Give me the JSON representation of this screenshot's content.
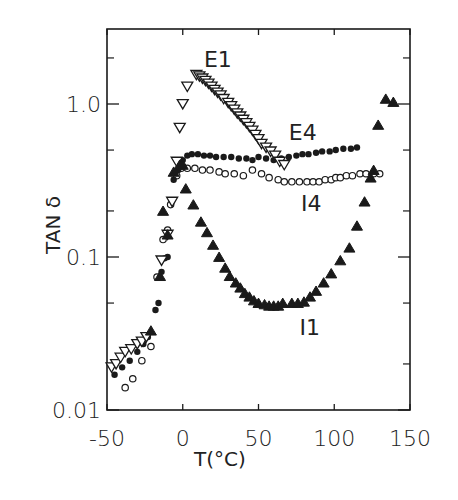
{
  "chart_data": {
    "type": "scatter",
    "title": "",
    "xlabel": "T(°C)",
    "ylabel": "TAN δ",
    "xscale": "linear",
    "yscale": "log",
    "xlim": [
      -50,
      150
    ],
    "ylim": [
      0.01,
      3.0
    ],
    "xticks": [
      -50,
      0,
      50,
      100,
      150
    ],
    "xtick_labels": [
      "-50",
      "0",
      "50",
      "100",
      "150"
    ],
    "yticks": [
      0.01,
      0.1,
      1.0
    ],
    "ytick_labels": [
      "0.01",
      "0.1",
      "1.0"
    ],
    "y_minor_ticks": [
      0.02,
      0.05,
      0.2,
      0.5,
      2.0
    ],
    "grid": false,
    "legend": "inline labels",
    "series": [
      {
        "name": "E1",
        "marker": "open-down-triangle",
        "label_pos": {
          "x": 14,
          "y": 1.75
        },
        "points": [
          [
            -47,
            0.019
          ],
          [
            -44,
            0.02
          ],
          [
            -41,
            0.022
          ],
          [
            -38,
            0.024
          ],
          [
            -34,
            0.025
          ],
          [
            -30,
            0.027
          ],
          [
            -27,
            0.028
          ],
          [
            -24,
            0.03
          ],
          [
            -14,
            0.095
          ],
          [
            -10,
            0.14
          ],
          [
            -7,
            0.23
          ],
          [
            -4,
            0.42
          ],
          [
            -2,
            0.7
          ],
          [
            0,
            1.0
          ],
          [
            3,
            1.3
          ],
          [
            9,
            1.55
          ],
          [
            11,
            1.52
          ],
          [
            13,
            1.47
          ],
          [
            15,
            1.42
          ],
          [
            17,
            1.36
          ],
          [
            19,
            1.3
          ],
          [
            21,
            1.24
          ],
          [
            23,
            1.19
          ],
          [
            25,
            1.14
          ],
          [
            27,
            1.08
          ],
          [
            30,
            1.02
          ],
          [
            32,
            0.97
          ],
          [
            34,
            0.92
          ],
          [
            36,
            0.87
          ],
          [
            38,
            0.83
          ],
          [
            40,
            0.79
          ],
          [
            42,
            0.75
          ],
          [
            44,
            0.71
          ],
          [
            46,
            0.67
          ],
          [
            48,
            0.63
          ],
          [
            50,
            0.59
          ],
          [
            52,
            0.55
          ],
          [
            55,
            0.52
          ],
          [
            58,
            0.49
          ],
          [
            61,
            0.46
          ],
          [
            64,
            0.42
          ],
          [
            67,
            0.4
          ]
        ]
      },
      {
        "name": "E4",
        "marker": "filled-circle",
        "label_pos": {
          "x": 70,
          "y": 0.58
        },
        "points": [
          [
            -45,
            0.017
          ],
          [
            -40,
            0.019
          ],
          [
            -35,
            0.021
          ],
          [
            -30,
            0.024
          ],
          [
            -26,
            0.027
          ],
          [
            -23,
            0.03
          ],
          [
            -18,
            0.045
          ],
          [
            -16,
            0.05
          ],
          [
            -14,
            0.08
          ],
          [
            -12,
            0.098
          ],
          [
            -10,
            0.1
          ],
          [
            -6,
            0.32
          ],
          [
            -3,
            0.37
          ],
          [
            0,
            0.43
          ],
          [
            3,
            0.46
          ],
          [
            6,
            0.47
          ],
          [
            10,
            0.47
          ],
          [
            14,
            0.46
          ],
          [
            18,
            0.46
          ],
          [
            22,
            0.45
          ],
          [
            27,
            0.45
          ],
          [
            32,
            0.45
          ],
          [
            37,
            0.44
          ],
          [
            42,
            0.44
          ],
          [
            46,
            0.43
          ],
          [
            50,
            0.45
          ],
          [
            55,
            0.44
          ],
          [
            60,
            0.43
          ],
          [
            65,
            0.44
          ],
          [
            70,
            0.45
          ],
          [
            75,
            0.46
          ],
          [
            79,
            0.47
          ],
          [
            83,
            0.47
          ],
          [
            88,
            0.48
          ],
          [
            92,
            0.49
          ],
          [
            97,
            0.49
          ],
          [
            101,
            0.5
          ],
          [
            106,
            0.51
          ],
          [
            111,
            0.51
          ],
          [
            115,
            0.52
          ]
        ]
      },
      {
        "name": "I4",
        "marker": "open-circle",
        "label_pos": {
          "x": 78,
          "y": 0.2
        },
        "points": [
          [
            -38,
            0.014
          ],
          [
            -33,
            0.016
          ],
          [
            -27,
            0.021
          ],
          [
            -21,
            0.026
          ],
          [
            -17,
            0.074
          ],
          [
            -13,
            0.13
          ],
          [
            -10,
            0.15
          ],
          [
            -8,
            0.22
          ],
          [
            -4,
            0.34
          ],
          [
            -1,
            0.38
          ],
          [
            3,
            0.38
          ],
          [
            8,
            0.38
          ],
          [
            13,
            0.37
          ],
          [
            18,
            0.37
          ],
          [
            24,
            0.36
          ],
          [
            28,
            0.35
          ],
          [
            34,
            0.35
          ],
          [
            40,
            0.34
          ],
          [
            46,
            0.37
          ],
          [
            52,
            0.35
          ],
          [
            57,
            0.33
          ],
          [
            63,
            0.32
          ],
          [
            67,
            0.31
          ],
          [
            72,
            0.31
          ],
          [
            77,
            0.31
          ],
          [
            82,
            0.31
          ],
          [
            86,
            0.31
          ],
          [
            90,
            0.31
          ],
          [
            94,
            0.32
          ],
          [
            98,
            0.32
          ],
          [
            101,
            0.33
          ],
          [
            104,
            0.33
          ],
          [
            108,
            0.34
          ],
          [
            112,
            0.34
          ],
          [
            117,
            0.35
          ],
          [
            121,
            0.35
          ],
          [
            126,
            0.35
          ],
          [
            130,
            0.35
          ]
        ]
      },
      {
        "name": "I1",
        "marker": "filled-up-triangle",
        "label_pos": {
          "x": 77,
          "y": 0.031
        },
        "points": [
          [
            -21,
            0.033
          ],
          [
            -15,
            0.075
          ],
          [
            -13,
            0.2
          ],
          [
            -10,
            0.14
          ],
          [
            -6,
            0.36
          ],
          [
            -2,
            0.4
          ],
          [
            0,
            0.4
          ],
          [
            2,
            0.28
          ],
          [
            7,
            0.22
          ],
          [
            12,
            0.17
          ],
          [
            16,
            0.145
          ],
          [
            20,
            0.12
          ],
          [
            24,
            0.1
          ],
          [
            28,
            0.085
          ],
          [
            31,
            0.075
          ],
          [
            35,
            0.068
          ],
          [
            38,
            0.063
          ],
          [
            41,
            0.058
          ],
          [
            44,
            0.055
          ],
          [
            47,
            0.052
          ],
          [
            50,
            0.05
          ],
          [
            54,
            0.049
          ],
          [
            57,
            0.048
          ],
          [
            60,
            0.048
          ],
          [
            63,
            0.048
          ],
          [
            66,
            0.05
          ],
          [
            72,
            0.05
          ],
          [
            76,
            0.05
          ],
          [
            80,
            0.051
          ],
          [
            84,
            0.055
          ],
          [
            88,
            0.06
          ],
          [
            93,
            0.068
          ],
          [
            98,
            0.078
          ],
          [
            104,
            0.095
          ],
          [
            110,
            0.115
          ],
          [
            115,
            0.16
          ],
          [
            120,
            0.23
          ],
          [
            124,
            0.33
          ],
          [
            126,
            0.37
          ],
          [
            129,
            0.73
          ],
          [
            134,
            1.08
          ],
          [
            139,
            1.03
          ]
        ]
      }
    ]
  }
}
